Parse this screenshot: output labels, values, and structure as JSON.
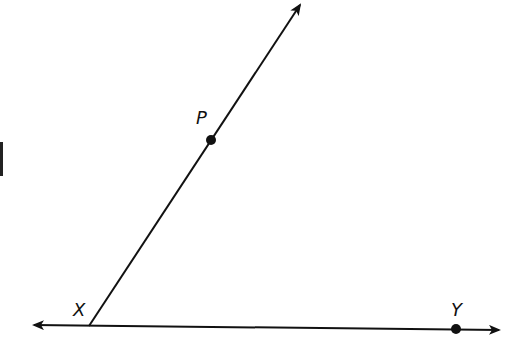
{
  "diagram": {
    "type": "geometry-angle",
    "points": {
      "X": {
        "label": "X",
        "x": 89,
        "y": 326
      },
      "P": {
        "label": "P",
        "x": 211,
        "y": 140
      },
      "Y": {
        "label": "Y",
        "x": 456,
        "y": 329
      }
    },
    "edge_mark": "1",
    "colors": {
      "stroke": "#111111",
      "background": "#ffffff"
    }
  }
}
